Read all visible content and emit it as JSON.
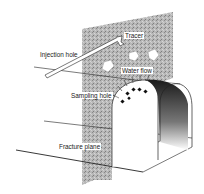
{
  "diagram": {
    "type": "tunnel-tracer-experiment",
    "labels": {
      "tracer": "Tracer",
      "injection_hole": "Injection hole",
      "water_flow": "Water flow",
      "sampling_hole": "Sampling hole",
      "fracture_plane": "Fracture plane"
    },
    "colors": {
      "rock_plane": "#b4b4b4",
      "line": "#222222",
      "background": "#ffffff",
      "tunnel_shading": "#333333"
    }
  }
}
